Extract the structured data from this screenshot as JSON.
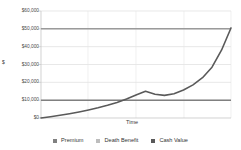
{
  "chart_data": {
    "type": "line",
    "title": "",
    "xlabel": "Time",
    "ylabel": "$",
    "ylim": [
      0,
      60000
    ],
    "xlim": [
      0,
      40
    ],
    "grid": true,
    "grid_orientation": "horizontal-and-vertical",
    "legend_position": "bottom",
    "ytick_labels": [
      "$0",
      "$10,000",
      "$20,000",
      "$30,000",
      "$40,000",
      "$50,000",
      "$60,000"
    ],
    "ytick_values": [
      0,
      10000,
      20000,
      30000,
      40000,
      50000,
      60000
    ],
    "xtick_labels": [],
    "series": [
      {
        "name": "Premium",
        "color": "#808080",
        "style": "horizontal-line",
        "x": [
          0,
          40
        ],
        "values": [
          10000,
          10000
        ]
      },
      {
        "name": "Death Benefit",
        "color": "#9a9a9a",
        "style": "horizontal-line",
        "x": [
          0,
          40
        ],
        "values": [
          50000,
          50000
        ]
      },
      {
        "name": "Cash Value",
        "color": "#5a5a5a",
        "style": "curve",
        "x": [
          0,
          2,
          4,
          6,
          8,
          10,
          12,
          14,
          16,
          18,
          20,
          22,
          24,
          26,
          28,
          30,
          32,
          34,
          36,
          38,
          40
        ],
        "values": [
          0,
          700,
          1500,
          2400,
          3400,
          4500,
          5700,
          7100,
          8700,
          10600,
          12900,
          15000,
          13300,
          12700,
          13600,
          15700,
          18600,
          22600,
          28500,
          38000,
          50500
        ]
      }
    ]
  },
  "legend": {
    "entries": [
      {
        "label": "Premium",
        "color": "#808080"
      },
      {
        "label": "Death Benefit",
        "color": "#bdbdbd"
      },
      {
        "label": "Cash Value",
        "color": "#595959"
      }
    ]
  },
  "axes": {
    "y_title": "$",
    "x_title": "Time"
  }
}
